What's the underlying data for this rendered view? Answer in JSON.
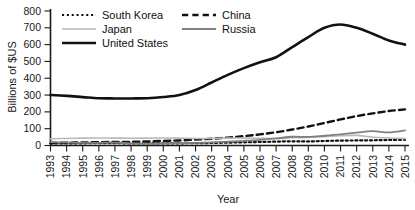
{
  "chart_data": {
    "type": "line",
    "title": "",
    "xlabel": "Year",
    "ylabel": "Billions of $US",
    "x": [
      1993,
      1994,
      1995,
      1996,
      1997,
      1998,
      1999,
      2000,
      2001,
      2002,
      2003,
      2004,
      2005,
      2006,
      2007,
      2008,
      2009,
      2010,
      2011,
      2012,
      2013,
      2014,
      2015
    ],
    "categories": [
      "1993",
      "1994",
      "1995",
      "1996",
      "1997",
      "1998",
      "1999",
      "2000",
      "2001",
      "2002",
      "2003",
      "2004",
      "2005",
      "2006",
      "2007",
      "2008",
      "2009",
      "2010",
      "2011",
      "2012",
      "2013",
      "2014",
      "2015"
    ],
    "ylim": [
      0,
      800
    ],
    "yticks": [
      0,
      100,
      200,
      300,
      400,
      500,
      600,
      700,
      800
    ],
    "ytick_labels": [
      "0",
      "100",
      "200",
      "300",
      "400",
      "500",
      "600",
      "700",
      "800"
    ],
    "xlim": [
      1993,
      2015
    ],
    "grid": false,
    "legend_position": "top-left-inside",
    "series": [
      {
        "name": "South Korea",
        "style": "dotted",
        "color": "#111111",
        "width": 2.2,
        "values": [
          12,
          12,
          13,
          14,
          14,
          12,
          12,
          13,
          13,
          14,
          15,
          17,
          19,
          21,
          23,
          25,
          24,
          27,
          29,
          30,
          31,
          33,
          34
        ]
      },
      {
        "name": "China",
        "style": "dashed",
        "color": "#111111",
        "width": 2.4,
        "values": [
          15,
          17,
          18,
          20,
          21,
          22,
          24,
          27,
          30,
          35,
          40,
          47,
          56,
          66,
          79,
          95,
          113,
          134,
          155,
          175,
          191,
          205,
          215
        ]
      },
      {
        "name": "Japan",
        "style": "solid",
        "color": "#b9b9b9",
        "width": 1.6,
        "values": [
          40,
          42,
          44,
          45,
          44,
          43,
          44,
          45,
          44,
          42,
          42,
          44,
          44,
          43,
          42,
          46,
          48,
          52,
          58,
          60,
          49,
          45,
          41
        ]
      },
      {
        "name": "Russia",
        "style": "solid",
        "color": "#808080",
        "width": 1.8,
        "values": [
          20,
          18,
          16,
          16,
          17,
          13,
          10,
          12,
          14,
          16,
          19,
          23,
          28,
          34,
          42,
          52,
          51,
          58,
          66,
          76,
          85,
          78,
          90
        ]
      },
      {
        "name": "United States",
        "style": "solid",
        "color": "#111111",
        "width": 2.6,
        "values": [
          300,
          295,
          288,
          281,
          280,
          280,
          281,
          288,
          300,
          330,
          375,
          420,
          460,
          495,
          525,
          585,
          645,
          700,
          720,
          700,
          665,
          625,
          600
        ]
      }
    ]
  },
  "legend": {
    "entries": [
      {
        "label": "South Korea",
        "key": "south-korea"
      },
      {
        "label": "China",
        "key": "china"
      },
      {
        "label": "Japan",
        "key": "japan"
      },
      {
        "label": "Russia",
        "key": "russia"
      },
      {
        "label": "United States",
        "key": "united-states"
      }
    ]
  },
  "colors": {
    "axis": "#1a1a1a",
    "text": "#111111",
    "background": "#ffffff",
    "japan": "#b9b9b9",
    "russia": "#808080",
    "dark": "#111111"
  }
}
